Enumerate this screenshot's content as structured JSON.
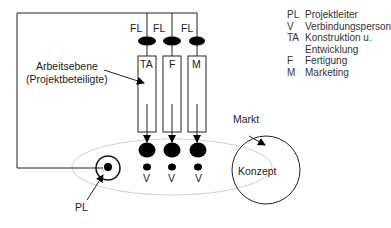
{
  "diagram": {
    "top_labels": [
      "FL",
      "FL",
      "FL"
    ],
    "columns": [
      {
        "id": "ta",
        "label": "TA"
      },
      {
        "id": "f",
        "label": "F"
      },
      {
        "id": "m",
        "label": "M"
      }
    ],
    "connector_labels": [
      "V",
      "V",
      "V"
    ],
    "work_level_label_line1": "Arbeitsebene",
    "work_level_label_line2": "(Projektbeteiligte)",
    "pl_label": "PL",
    "market_label": "Markt",
    "concept_label": "Konzept"
  },
  "legend": [
    {
      "abbr": "PL",
      "text": "Projektleiter"
    },
    {
      "abbr": "V",
      "text": "Verbindungsperson"
    },
    {
      "abbr": "TA",
      "text": "Konstruktion u."
    },
    {
      "abbr": "",
      "text": "Entwicklung"
    },
    {
      "abbr": "F",
      "text": "Fertigung"
    },
    {
      "abbr": "M",
      "text": "Marketing"
    }
  ],
  "colors": {
    "line": "#222222",
    "fill": "#000000",
    "ellipse": "#cccccc"
  }
}
